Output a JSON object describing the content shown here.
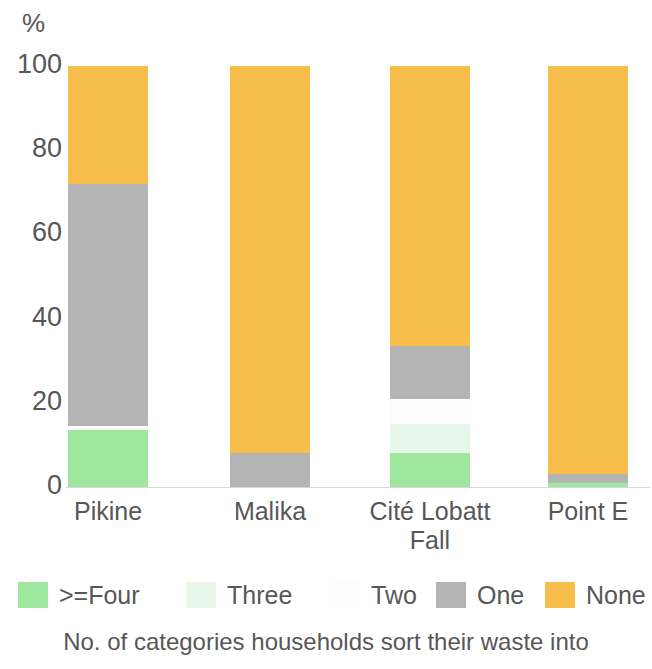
{
  "chart_data": {
    "type": "bar",
    "subtype": "stacked-bar-100-percent",
    "title": "",
    "xlabel": "No. of categories households sort their waste into",
    "ylabel": "%",
    "ylim": [
      0,
      100
    ],
    "yticks": [
      0,
      20,
      40,
      60,
      80,
      100
    ],
    "ytick_labels": [
      "0",
      "20",
      "40",
      "60",
      "80",
      "100"
    ],
    "grid": false,
    "legend_position": "bottom",
    "categories": [
      "Pikine",
      "Malika",
      "Cité Lobatt Fall",
      "Point E"
    ],
    "category_labels_multiline": [
      "Pikine",
      "Malika",
      "Cité Lobatt\nFall",
      "Point E"
    ],
    "stack_order_bottom_to_top": [
      ">=Four",
      "Three",
      "Two",
      "One",
      "None"
    ],
    "series": [
      {
        "name": ">=Four",
        "color": "#9de89e",
        "values": [
          13.5,
          0,
          8,
          1
        ]
      },
      {
        "name": "Three",
        "color": "#e6f7e9",
        "values": [
          0,
          0,
          7,
          0
        ]
      },
      {
        "name": "Two",
        "color": "#fdfdfd",
        "values": [
          1,
          0,
          6,
          0
        ]
      },
      {
        "name": "One",
        "color": "#b4b4b4",
        "values": [
          57.5,
          8,
          12.5,
          2
        ]
      },
      {
        "name": "None",
        "color": "#f7be4b",
        "values": [
          28,
          92,
          66.5,
          97
        ]
      }
    ]
  },
  "axis": {
    "y_unit": "%",
    "y_ticks": [
      {
        "label": "100",
        "value": 100
      },
      {
        "label": "80",
        "value": 80
      },
      {
        "label": "60",
        "value": 60
      },
      {
        "label": "40",
        "value": 40
      },
      {
        "label": "20",
        "value": 20
      },
      {
        "label": "0",
        "value": 0
      }
    ]
  },
  "x_labels": [
    {
      "line1": "Pikine",
      "line2": ""
    },
    {
      "line1": "Malika",
      "line2": ""
    },
    {
      "line1": "Cité Lobatt",
      "line2": "Fall"
    },
    {
      "line1": "Point E",
      "line2": ""
    }
  ],
  "legend": {
    "items": [
      {
        "label": ">=Four",
        "color": "#9de89e"
      },
      {
        "label": "Three",
        "color": "#e8f7ea"
      },
      {
        "label": "Two",
        "color": "#fdfdfd"
      },
      {
        "label": "One",
        "color": "#b4b4b4"
      },
      {
        "label": "None",
        "color": "#f7be4b"
      }
    ]
  },
  "caption": "No. of categories households sort their waste into",
  "colors": {
    "four_plus": "#9de89e",
    "three": "#e8f7ea",
    "two": "#fdfdfd",
    "one": "#b4b4b4",
    "none": "#f7be4b",
    "text": "#575757",
    "axis_line": "#d8d8d8",
    "background": "#ffffff"
  }
}
